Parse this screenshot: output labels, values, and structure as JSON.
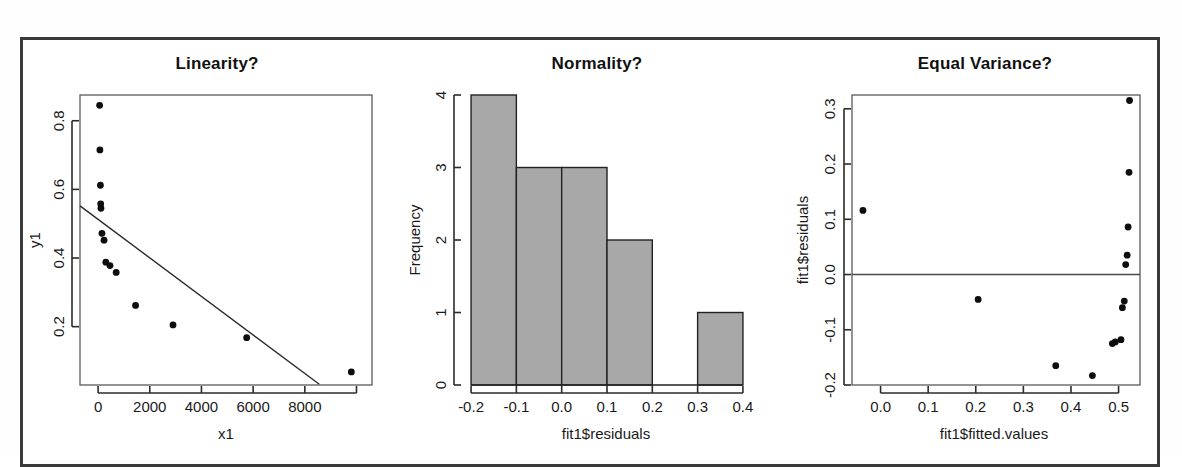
{
  "figure": {
    "background_color": "#ffffff",
    "frame_color": "#3a3a3a",
    "point_color": "#0d0d0d",
    "bar_fill_color": "#a8a8a8",
    "bar_edge_color": "#222222"
  },
  "panels": [
    {
      "id": "linearity",
      "title": "Linearity?",
      "xlabel": "x1",
      "ylabel": "y1"
    },
    {
      "id": "normality",
      "title": "Normality?",
      "xlabel": "fit1$residuals",
      "ylabel": "Frequency"
    },
    {
      "id": "equal-variance",
      "title": "Equal Variance?",
      "xlabel": "fit1$fitted.values",
      "ylabel": "fit1$residuals"
    }
  ],
  "chart_data": [
    {
      "type": "scatter",
      "title": "Linearity?",
      "xlabel": "x1",
      "ylabel": "y1",
      "xlim": [
        -700,
        10600
      ],
      "ylim": [
        0.03,
        0.875
      ],
      "xticks": [
        0,
        2000,
        4000,
        6000,
        8000
      ],
      "xtick_labels": [
        "0",
        "2000",
        "4000",
        "6000",
        "8000"
      ],
      "yticks": [
        0.2,
        0.4,
        0.6,
        0.8
      ],
      "ytick_labels": [
        "0.2",
        "0.4",
        "0.6",
        "0.8"
      ],
      "grid": false,
      "legend": "none",
      "x": [
        60,
        70,
        90,
        100,
        110,
        150,
        230,
        300,
        460,
        700,
        1450,
        2900,
        5750,
        9800
      ],
      "y": [
        0.845,
        0.715,
        0.612,
        0.558,
        0.545,
        0.472,
        0.452,
        0.388,
        0.378,
        0.358,
        0.262,
        0.205,
        0.168,
        0.068
      ],
      "fit_line": {
        "label": "least-squares fit",
        "x": [
          -700,
          8560
        ],
        "y": [
          0.552,
          0.032
        ],
        "intercept": 0.5485,
        "slope": -5.62e-05
      }
    },
    {
      "type": "bar",
      "subtype": "histogram",
      "title": "Normality?",
      "xlabel": "fit1$residuals",
      "ylabel": "Frequency",
      "xlim": [
        -0.22,
        0.42
      ],
      "ylim": [
        0,
        4
      ],
      "xticks": [
        -0.2,
        -0.1,
        0.0,
        0.1,
        0.2,
        0.3,
        0.4
      ],
      "xtick_labels": [
        "-0.2",
        "-0.1",
        "0.0",
        "0.1",
        "0.2",
        "0.3",
        "0.4"
      ],
      "yticks": [
        0,
        1,
        2,
        3,
        4
      ],
      "ytick_labels": [
        "0",
        "1",
        "2",
        "3",
        "4"
      ],
      "grid": false,
      "legend": "none",
      "bin_edges": [
        -0.2,
        -0.1,
        0.0,
        0.1,
        0.2,
        0.3,
        0.4
      ],
      "categories": [
        "-0.2 to -0.1",
        "-0.1 to 0.0",
        "0.0 to 0.1",
        "0.1 to 0.2",
        "0.2 to 0.3",
        "0.3 to 0.4"
      ],
      "values": [
        4,
        3,
        3,
        2,
        0,
        1
      ]
    },
    {
      "type": "scatter",
      "title": "Equal Variance?",
      "xlabel": "fit1$fitted.values",
      "ylabel": "fit1$residuals",
      "xlim": [
        -0.06,
        0.545
      ],
      "ylim": [
        -0.2,
        0.325
      ],
      "xticks": [
        0.0,
        0.1,
        0.2,
        0.3,
        0.4,
        0.5
      ],
      "xtick_labels": [
        "0.0",
        "0.1",
        "0.2",
        "0.3",
        "0.4",
        "0.5"
      ],
      "yticks": [
        -0.2,
        -0.1,
        0.0,
        0.1,
        0.2,
        0.3
      ],
      "ytick_labels": [
        "-0.2",
        "-0.1",
        "0.0",
        "0.1",
        "0.2",
        "0.3"
      ],
      "grid": false,
      "legend": "none",
      "reference_line_y": 0.0,
      "x": [
        -0.037,
        0.205,
        0.368,
        0.445,
        0.487,
        0.493,
        0.505,
        0.508,
        0.512,
        0.515,
        0.518,
        0.52,
        0.522
      ],
      "y": [
        0.116,
        -0.045,
        -0.165,
        -0.183,
        -0.125,
        -0.122,
        -0.118,
        -0.06,
        -0.048,
        0.018,
        0.035,
        0.086,
        0.185
      ]
    }
  ],
  "extra_points": {
    "equal_variance_top": {
      "x": 0.523,
      "y": 0.315
    }
  }
}
